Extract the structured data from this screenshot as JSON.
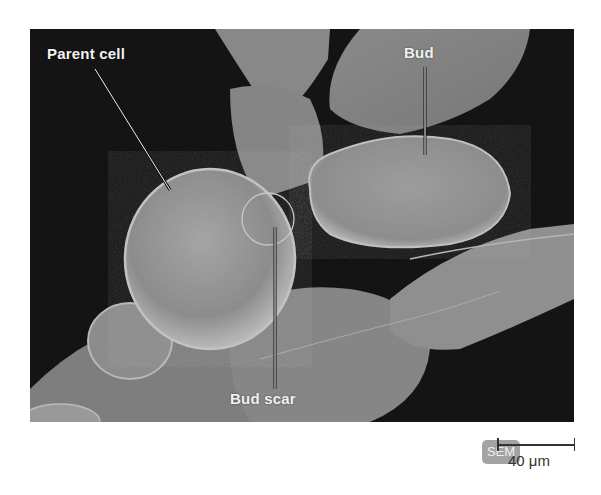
{
  "figure": {
    "type": "SEM micrograph",
    "labels": {
      "parent_cell": "Parent cell",
      "bud": "Bud",
      "bud_scar": "Bud scar"
    },
    "badge": "SEM",
    "scale_bar": {
      "value": "40 μm"
    },
    "colors": {
      "background": "#141414",
      "cell_surface": "#8c8c8c",
      "label_text": "#f2f2f2",
      "badge_bg": "#a3a3a3",
      "scale_bar": "#333333"
    }
  }
}
